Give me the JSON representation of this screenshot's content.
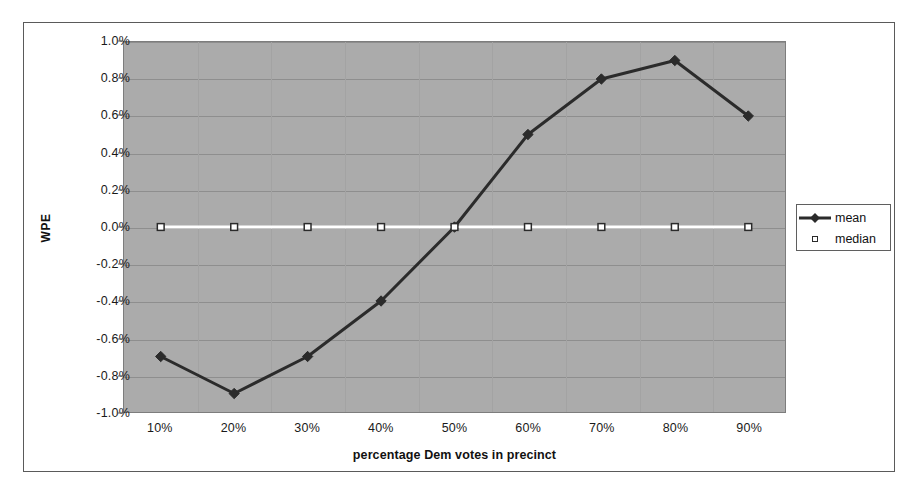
{
  "chart_data": {
    "type": "line",
    "title": "",
    "xlabel": "percentage Dem votes in precinct",
    "ylabel": "WPE",
    "categories": [
      "10%",
      "20%",
      "30%",
      "40%",
      "50%",
      "60%",
      "70%",
      "80%",
      "90%"
    ],
    "x_values": [
      10,
      20,
      30,
      40,
      50,
      60,
      70,
      80,
      90
    ],
    "ylim": [
      -1.0,
      1.0
    ],
    "ytick_labels": [
      "1.0%",
      "0.8%",
      "0.6%",
      "0.4%",
      "0.2%",
      "0.0%",
      "-0.2%",
      "-0.4%",
      "-0.6%",
      "-0.8%",
      "-1.0%"
    ],
    "ytick_values": [
      1.0,
      0.8,
      0.6,
      0.4,
      0.2,
      0.0,
      -0.2,
      -0.4,
      -0.6,
      -0.8,
      -1.0
    ],
    "y_unit": "%",
    "grid": true,
    "grid_orientation": "horizontal",
    "legend_position": "right",
    "plot_background": "#ababab",
    "series": [
      {
        "name": "mean",
        "color": "#2b2b2b",
        "marker": "diamond",
        "line_width": 3,
        "values": [
          -0.7,
          -0.9,
          -0.7,
          -0.4,
          0.0,
          0.5,
          0.8,
          0.9,
          0.6
        ]
      },
      {
        "name": "median",
        "color": "#ffffff",
        "marker": "open-square",
        "line_width": 3,
        "values": [
          0.0,
          0.0,
          0.0,
          0.0,
          0.0,
          0.0,
          0.0,
          0.0,
          0.0
        ]
      }
    ]
  },
  "legend": {
    "entries": [
      {
        "label": "mean",
        "marker": "diamond-line-icon"
      },
      {
        "label": "median",
        "marker": "open-square-icon"
      }
    ]
  },
  "axes": {
    "y_title": "WPE",
    "x_title": "percentage Dem votes in precinct"
  }
}
